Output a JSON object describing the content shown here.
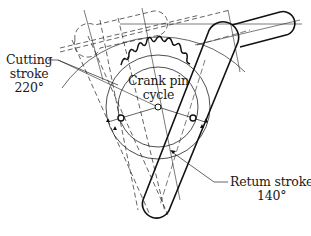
{
  "diagram": {
    "labels": {
      "cutting_stroke": {
        "line1": "Cutting",
        "line2": "stroke",
        "angle": "220°"
      },
      "crank_pin": {
        "line1": "Crank pin",
        "line2": "cycle"
      },
      "return_stroke": {
        "line1": "Retum stroke",
        "angle": "140°"
      }
    },
    "colors": {
      "ink": "#1a1a1a",
      "background": "#ffffff"
    }
  }
}
